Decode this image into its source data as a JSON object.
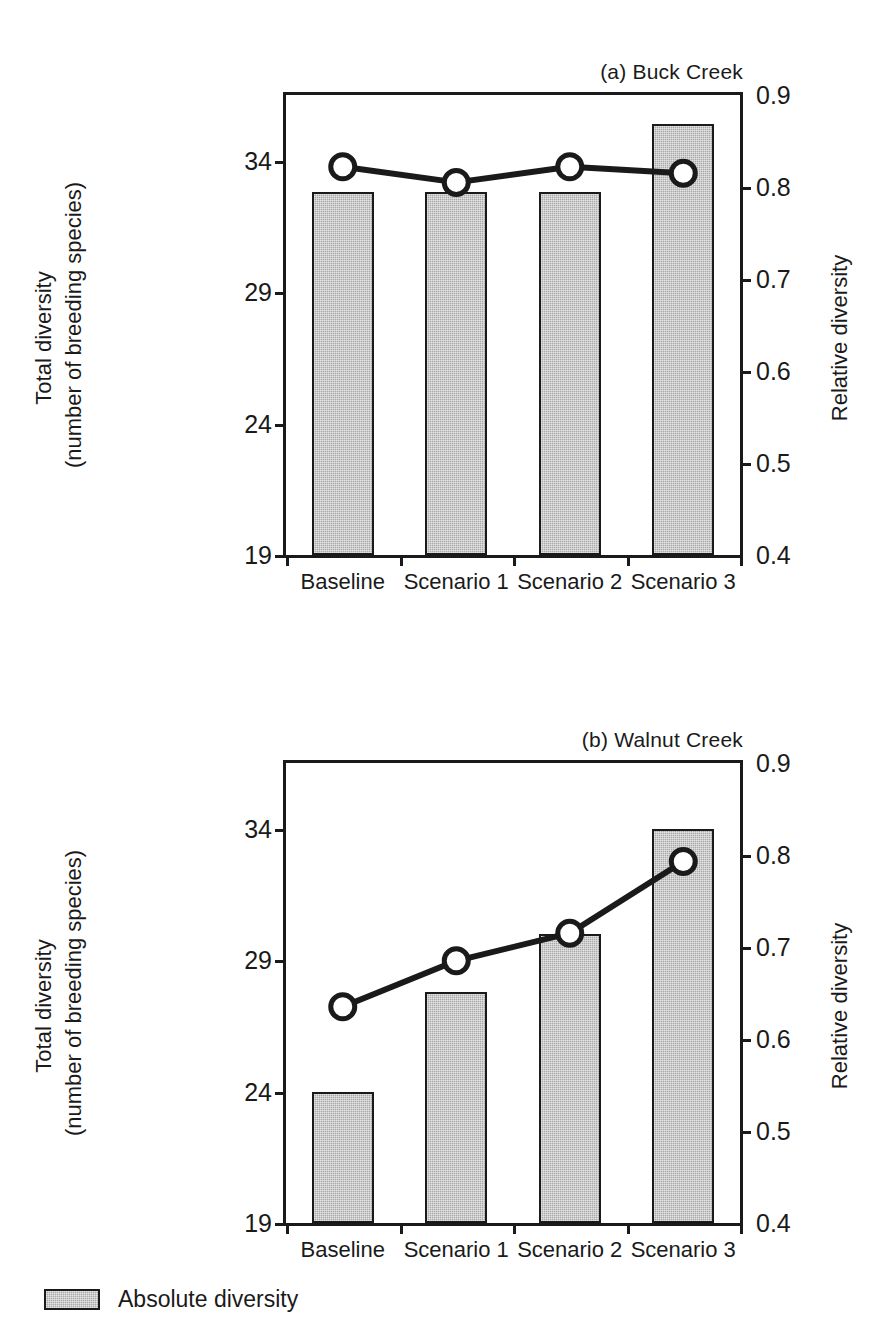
{
  "figure": {
    "clipped_header": "",
    "background": "#ffffff",
    "bar_fill": "#a9a9a9",
    "ink": "#1a1a1a"
  },
  "legend": {
    "items": [
      {
        "label": "Absolute diversity",
        "swatch": "legend-swatch-gray",
        "color": "#a9a9a9"
      }
    ]
  },
  "axes": {
    "left_title_line1": "Total diversity",
    "left_title_line2": "(number of breeding species)",
    "right_title": "Relative diversity",
    "left_ticks": [
      "19",
      "24",
      "29",
      "34"
    ],
    "right_ticks": [
      "0.4",
      "0.5",
      "0.6",
      "0.7",
      "0.8",
      "0.9"
    ],
    "categories": [
      "Baseline",
      "Scenario 1",
      "Scenario 2",
      "Scenario 3"
    ]
  },
  "panels": [
    {
      "id": "a",
      "title": "(a) Buck Creek"
    },
    {
      "id": "b",
      "title": "(b) Walnut Creek"
    }
  ],
  "chart_data": [
    {
      "type": "bar",
      "title": "(a) Buck Creek",
      "xlabel": "",
      "ylabel": "Total diversity (number of breeding species)",
      "y2label": "Relative diversity",
      "categories": [
        "Baseline",
        "Scenario 1",
        "Scenario 2",
        "Scenario 3"
      ],
      "ylim": [
        19,
        36.5
      ],
      "y2lim": [
        0.4,
        0.9
      ],
      "yticks": [
        19,
        24,
        29,
        34
      ],
      "y2ticks": [
        0.4,
        0.5,
        0.6,
        0.7,
        0.8,
        0.9
      ],
      "grid": false,
      "legend_position": "below-figure",
      "series": [
        {
          "name": "Absolute diversity",
          "type": "bar",
          "axis": "left",
          "values": [
            32.8,
            32.8,
            32.8,
            35.4
          ]
        },
        {
          "name": "Relative diversity",
          "type": "line",
          "axis": "right",
          "marker": "open-circle",
          "values": [
            0.822,
            0.805,
            0.822,
            0.815
          ]
        }
      ]
    },
    {
      "type": "bar",
      "title": "(b) Walnut Creek",
      "xlabel": "",
      "ylabel": "Total diversity (number of breeding species)",
      "y2label": "Relative diversity",
      "categories": [
        "Baseline",
        "Scenario 1",
        "Scenario 2",
        "Scenario 3"
      ],
      "ylim": [
        19,
        36.5
      ],
      "y2lim": [
        0.4,
        0.9
      ],
      "yticks": [
        19,
        24,
        29,
        34
      ],
      "y2ticks": [
        0.4,
        0.5,
        0.6,
        0.7,
        0.8,
        0.9
      ],
      "grid": false,
      "legend_position": "below-figure",
      "series": [
        {
          "name": "Absolute diversity",
          "type": "bar",
          "axis": "left",
          "values": [
            24.0,
            27.8,
            30.0,
            34.0
          ]
        },
        {
          "name": "Relative diversity",
          "type": "line",
          "axis": "right",
          "marker": "open-circle",
          "values": [
            0.635,
            0.685,
            0.715,
            0.793
          ]
        }
      ]
    }
  ]
}
